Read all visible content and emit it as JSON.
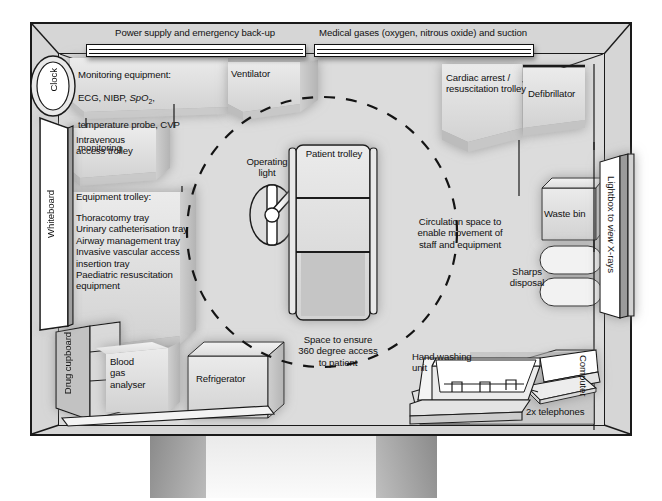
{
  "diagram": {
    "type": "floor-plan"
  },
  "wall_services": {
    "power": "Power supply and emergency back-up",
    "gases": "Medical gases (oxygen, nitrous oxide) and suction"
  },
  "labels": {
    "clock": "Clock",
    "monitoring_line1": "Monitoring equipment:",
    "monitoring_line2_a": "ECG, NIBP, ",
    "monitoring_line2_b": "SpO",
    "monitoring_line2_sub": "2",
    "monitoring_line2_c": ",",
    "monitoring_line3": "temperature probe, CVP",
    "monitoring_line4": "monitoring",
    "ventilator": "Ventilator",
    "cardiac_arrest_trolley": "Cardiac arrest /\nresuscitation trolley",
    "defibrillator": "Defibrillator",
    "intravenous_access_trolley": "Intravenous\naccess trolley",
    "equipment_trolley_heading": "Equipment trolley:",
    "equipment_trolley_items": "Thoracotomy tray\nUrinary catheterisation tray\nAirway management tray\nInvasive vascular access\ninsertion tray\nPaediatric resuscitation\nequipment",
    "whiteboard": "Whiteboard",
    "drug_cupboard": "Drug cupboard",
    "blood_gas_analyser": "Blood\ngas\nanalyser",
    "refrigerator": "Refrigerator",
    "operating_light": "Operating\nlight",
    "patient_trolley": "Patient trolley",
    "circulation_space": "Circulation space to\nenable movement of\nstaff and equipment",
    "access_360": "Space to ensure\n360 degree access\nto patient",
    "waste_bin": "Waste bin",
    "sharps_disposal": "Sharps\ndisposal",
    "lightbox_a": "Lightbox to ",
    "lightbox_b": "view",
    "lightbox_c": " X-rays",
    "hand_washing_unit": "Hand washing\nunit",
    "telephones": "2x telephones",
    "computer": "Computer"
  },
  "icons": {
    "clock": "clock-icon",
    "operating_light": "operating-light-icon",
    "telephone": "telephone-icon",
    "laptop": "laptop-computer-icon",
    "sink": "sink-tap-icon",
    "sharps": "sharps-container-icon"
  },
  "colors": {
    "outline": "#1a1a1a",
    "room_fill": "#dcdcdc",
    "object_fill": "#e2e2e2",
    "white_fill": "#ffffff",
    "drug_cupboard_fill": "#c3c3c3",
    "page_background": "#ffffff"
  }
}
